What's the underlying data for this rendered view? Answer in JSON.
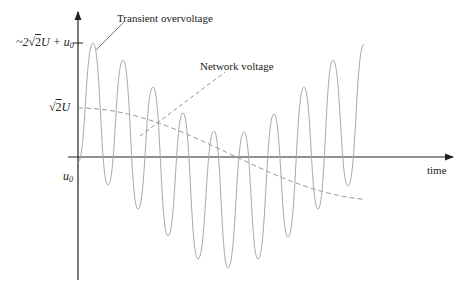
{
  "diagram": {
    "title": "",
    "labels": {
      "transient": "Transient overvoltage",
      "network": "Network voltage",
      "time_axis": "time"
    },
    "y_ticks": {
      "peak": {
        "prefix": "~2",
        "root": "√",
        "root_arg": "2",
        "var": "U + u",
        "sub": "0"
      },
      "network_peak": {
        "root": "√",
        "root_arg": "2",
        "var": "U"
      },
      "offset": {
        "var": "u",
        "sub": "0"
      }
    },
    "colors": {
      "axis": "#222222",
      "transient_curve": "#a8a8a8",
      "network_curve": "#9a9a9a",
      "leader": "#555555"
    }
  },
  "chart_data": {
    "type": "line",
    "title": "",
    "xlabel": "time",
    "ylabel": "",
    "grid": false,
    "legend": "callout labels",
    "series": [
      {
        "name": "Transient overvoltage",
        "style": "solid",
        "description": "Oscillation (~10 cycles) whose envelope is 2x network voltage added to offset u0; starts at u0, first peak ~2√2U+u0",
        "peaks_px": [
          [
            93,
            43
          ],
          [
            123,
            60
          ],
          [
            153,
            87
          ],
          [
            183,
            113
          ],
          [
            214,
            131
          ],
          [
            244,
            132
          ],
          [
            274,
            114
          ],
          [
            304,
            87
          ],
          [
            333,
            60
          ],
          [
            364,
            44
          ]
        ],
        "troughs_px": [
          [
            108,
            185
          ],
          [
            138,
            209
          ],
          [
            168,
            236
          ],
          [
            198,
            259
          ],
          [
            228,
            268
          ],
          [
            258,
            259
          ],
          [
            288,
            237
          ],
          [
            318,
            209
          ],
          [
            348,
            186
          ]
        ]
      },
      {
        "name": "Network voltage",
        "style": "dashed",
        "description": "Cosine starting at √2U, minimum near mid-time, rising back toward √2U",
        "points_px": [
          [
            78,
            108
          ],
          [
            130,
            130
          ],
          [
            180,
            180
          ],
          [
            230,
            200
          ],
          [
            280,
            180
          ],
          [
            330,
            130
          ],
          [
            365,
            112
          ]
        ]
      }
    ],
    "y_tick_labels": [
      "~2√2U + u0",
      "√2U",
      "u0"
    ]
  }
}
